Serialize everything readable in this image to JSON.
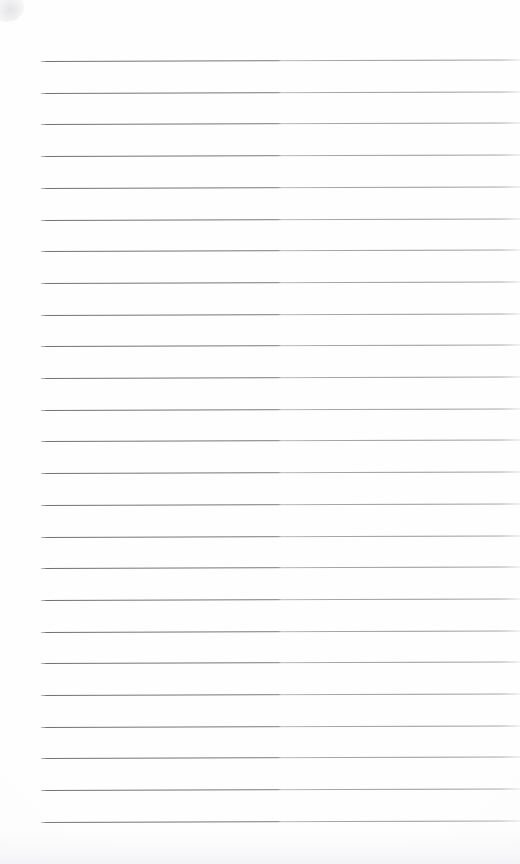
{
  "document": {
    "type": "lined-notebook-page",
    "title": "Blank ruled notebook page",
    "state": "blank",
    "written_content": "",
    "page_width_px": 520,
    "page_height_px": 864,
    "background_color": "#fefefe",
    "rule_color": "#70707a",
    "rule_thickness_px": 1,
    "rule_count": 25,
    "rule_left_x_px": 41,
    "rule_right_x_px": 520,
    "first_rule_y_px": 61,
    "rule_spacing_px": 31.7,
    "rule_slope_px": -1.6,
    "margin_rule_present": false,
    "top_margin_px": 61,
    "bottom_margin_px": 42,
    "left_margin_px": 41
  },
  "rules": [
    {
      "index": 1,
      "y": 61.0,
      "x_start": 41,
      "x_end": 520
    },
    {
      "index": 2,
      "y": 92.7,
      "x_start": 41,
      "x_end": 520
    },
    {
      "index": 3,
      "y": 124.4,
      "x_start": 41,
      "x_end": 520
    },
    {
      "index": 4,
      "y": 156.1,
      "x_start": 41,
      "x_end": 520
    },
    {
      "index": 5,
      "y": 187.8,
      "x_start": 41,
      "x_end": 520
    },
    {
      "index": 6,
      "y": 219.5,
      "x_start": 41,
      "x_end": 520
    },
    {
      "index": 7,
      "y": 251.2,
      "x_start": 41,
      "x_end": 520
    },
    {
      "index": 8,
      "y": 282.9,
      "x_start": 41,
      "x_end": 520
    },
    {
      "index": 9,
      "y": 314.6,
      "x_start": 41,
      "x_end": 520
    },
    {
      "index": 10,
      "y": 346.3,
      "x_start": 41,
      "x_end": 520
    },
    {
      "index": 11,
      "y": 378.0,
      "x_start": 41,
      "x_end": 520
    },
    {
      "index": 12,
      "y": 409.7,
      "x_start": 41,
      "x_end": 520
    },
    {
      "index": 13,
      "y": 441.4,
      "x_start": 41,
      "x_end": 520
    },
    {
      "index": 14,
      "y": 473.1,
      "x_start": 41,
      "x_end": 520
    },
    {
      "index": 15,
      "y": 504.8,
      "x_start": 41,
      "x_end": 520
    },
    {
      "index": 16,
      "y": 536.5,
      "x_start": 41,
      "x_end": 520
    },
    {
      "index": 17,
      "y": 568.2,
      "x_start": 41,
      "x_end": 520
    },
    {
      "index": 18,
      "y": 599.9,
      "x_start": 41,
      "x_end": 520
    },
    {
      "index": 19,
      "y": 631.6,
      "x_start": 41,
      "x_end": 520
    },
    {
      "index": 20,
      "y": 663.3,
      "x_start": 41,
      "x_end": 520
    },
    {
      "index": 21,
      "y": 695.0,
      "x_start": 41,
      "x_end": 520
    },
    {
      "index": 22,
      "y": 726.7,
      "x_start": 41,
      "x_end": 520
    },
    {
      "index": 23,
      "y": 758.4,
      "x_start": 41,
      "x_end": 520
    },
    {
      "index": 24,
      "y": 790.1,
      "x_start": 41,
      "x_end": 520
    },
    {
      "index": 25,
      "y": 821.8,
      "x_start": 41,
      "x_end": 520
    }
  ]
}
